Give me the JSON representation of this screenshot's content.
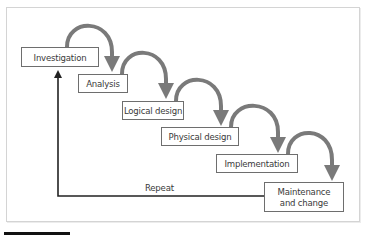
{
  "diagram": {
    "type": "waterfall-lifecycle",
    "stages": [
      {
        "label": "Investigation"
      },
      {
        "label": "Analysis"
      },
      {
        "label": "Logical design"
      },
      {
        "label": "Physical design"
      },
      {
        "label": "Implementation"
      },
      {
        "label": "Maintenance\nand change"
      }
    ],
    "feedback_loop": {
      "label": "Repeat",
      "from": "Maintenance and change",
      "to": "Investigation"
    },
    "colors": {
      "arc": "#7a7a7a",
      "box_border": "#6e6e6e",
      "text": "#3a3a3a",
      "repeat_line": "#222222",
      "frame": "#d4d4d4"
    }
  }
}
